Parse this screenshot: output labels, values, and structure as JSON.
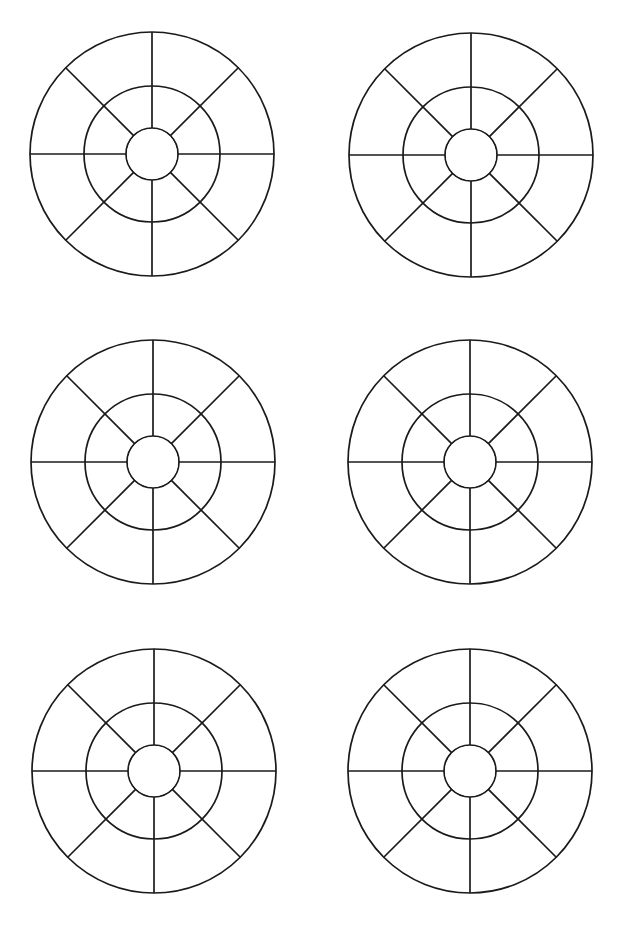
{
  "page": {
    "background": "#ffffff",
    "stroke_color": "#1a1a1a",
    "width": 622,
    "height": 932
  },
  "wheel_template": {
    "outer_radius": 122,
    "middle_radius": 68,
    "inner_radius": 26,
    "spokes": 8,
    "spoke_angles_deg": [
      0,
      45,
      90,
      135,
      180,
      225,
      270,
      315
    ]
  },
  "wheels": [
    {
      "id": "wheel-1",
      "row": 1,
      "col": 1,
      "cx": 152,
      "cy": 154
    },
    {
      "id": "wheel-2",
      "row": 1,
      "col": 2,
      "cx": 471,
      "cy": 155
    },
    {
      "id": "wheel-3",
      "row": 2,
      "col": 1,
      "cx": 153,
      "cy": 462
    },
    {
      "id": "wheel-4",
      "row": 2,
      "col": 2,
      "cx": 470,
      "cy": 462
    },
    {
      "id": "wheel-5",
      "row": 3,
      "col": 1,
      "cx": 154,
      "cy": 771
    },
    {
      "id": "wheel-6",
      "row": 3,
      "col": 2,
      "cx": 470,
      "cy": 771
    }
  ]
}
